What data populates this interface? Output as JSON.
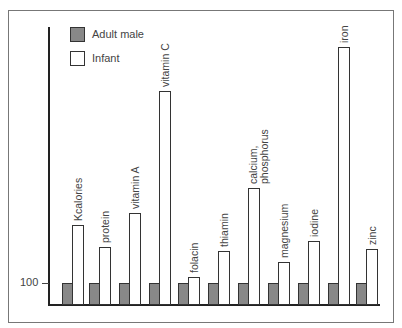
{
  "chart_data": {
    "type": "bar",
    "title": "",
    "xlabel": "",
    "ylabel": "",
    "y_tick_labels": [
      "100"
    ],
    "legend": [
      "Adult male",
      "Infant"
    ],
    "legend_position": "top-left",
    "grid": false,
    "categories": [
      "Kcalories",
      "protein",
      "vitamin A",
      "vitamin C",
      "folacin",
      "thiamin",
      "calcium, phosphorus",
      "magnesium",
      "iodine",
      "iron",
      "zinc"
    ],
    "series": [
      {
        "name": "Adult male",
        "values": [
          100,
          100,
          100,
          100,
          100,
          100,
          100,
          100,
          100,
          100,
          100
        ]
      },
      {
        "name": "Infant",
        "values": [
          364,
          264,
          418,
          973,
          127,
          245,
          532,
          195,
          291,
          1173,
          255
        ]
      }
    ],
    "ylim": [
      0,
      1270
    ],
    "colors": {
      "adult": "#888888",
      "infant": "#ffffff"
    }
  }
}
